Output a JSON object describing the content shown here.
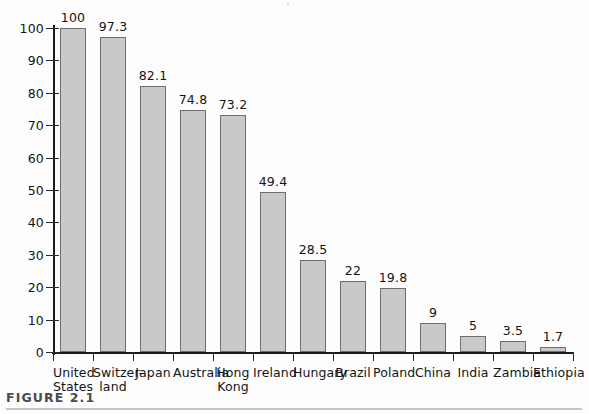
{
  "figure": {
    "caption_label": "FIGURE 2.1"
  },
  "chart_data": {
    "type": "bar",
    "title": "",
    "subtitle": "",
    "xlabel": "",
    "ylabel": "",
    "ylim": [
      0,
      100
    ],
    "yticks": [
      0,
      10,
      20,
      30,
      40,
      50,
      60,
      70,
      80,
      90,
      100
    ],
    "ytick_labels": [
      "0",
      "10",
      "20",
      "30",
      "40",
      "50",
      "60",
      "70",
      "80",
      "90",
      "100"
    ],
    "grid": false,
    "legend": null,
    "bar_color": "#c9c9c9",
    "bar_edge_color": "#6e6e6e",
    "axis_color": "#1b1b1b",
    "categories": [
      "United States",
      "Switzerland",
      "Japan",
      "Australia",
      "Hong Kong",
      "Ireland",
      "Hungary",
      "Brazil",
      "Poland",
      "China",
      "India",
      "Zambia",
      "Ethiopia"
    ],
    "category_lines": [
      [
        "United",
        "States"
      ],
      [
        "Switzer-",
        "land"
      ],
      [
        "Japan",
        ""
      ],
      [
        "Australia",
        ""
      ],
      [
        "Hong",
        "Kong"
      ],
      [
        "Ireland",
        ""
      ],
      [
        "Hungary",
        ""
      ],
      [
        "Brazil",
        ""
      ],
      [
        "Poland",
        ""
      ],
      [
        "China",
        ""
      ],
      [
        "India",
        ""
      ],
      [
        "Zambia",
        ""
      ],
      [
        "Ethiopia",
        ""
      ]
    ],
    "values": [
      100,
      97.3,
      82.1,
      74.8,
      73.2,
      49.4,
      28.5,
      22,
      19.8,
      9,
      5,
      3.5,
      1.7
    ],
    "value_labels": [
      "100",
      "97.3",
      "82.1",
      "74.8",
      "73.2",
      "49.4",
      "28.5",
      "22",
      "19.8",
      "9",
      "5",
      "3.5",
      "1.7"
    ]
  }
}
